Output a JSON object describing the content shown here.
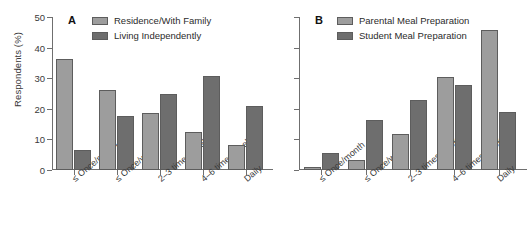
{
  "chart_data": [
    {
      "type": "bar",
      "panel": "A",
      "title": "",
      "xlabel": "",
      "ylabel": "Respondents (%)",
      "ylim": [
        0,
        50
      ],
      "yticks": [
        0,
        10,
        20,
        30,
        40,
        50
      ],
      "grid": false,
      "legend_position": "top-left",
      "categories": [
        "≤ Once/month",
        "≤ Once/week",
        "2–3 times/week",
        "4–6 times/week",
        "Daily"
      ],
      "series": [
        {
          "name": "Residence/With Family",
          "color": "#9d9d9d",
          "values": [
            36.3,
            26.2,
            18.7,
            12.5,
            8.2
          ]
        },
        {
          "name": "Living Independently",
          "color": "#6e6e6e",
          "values": [
            6.7,
            17.8,
            25.0,
            30.7,
            20.8
          ]
        }
      ]
    },
    {
      "type": "bar",
      "panel": "B",
      "title": "",
      "xlabel": "",
      "ylabel": "",
      "ylim": [
        0,
        50
      ],
      "yticks": [
        0,
        10,
        20,
        30,
        40,
        50
      ],
      "grid": false,
      "legend_position": "top-left",
      "categories": [
        "≤ Once/month",
        "≤ Once/week",
        "2–3 times/week",
        "4–6 times/week",
        "Daily"
      ],
      "series": [
        {
          "name": "Parental Meal Preparation",
          "color": "#9d9d9d",
          "values": [
            1.0,
            3.4,
            11.7,
            30.5,
            45.8
          ]
        },
        {
          "name": "Student Meal Preparation",
          "color": "#6e6e6e",
          "values": [
            5.7,
            16.2,
            23.0,
            27.8,
            18.8
          ]
        }
      ]
    }
  ],
  "axis": {
    "ylabel": "Respondents (%)",
    "ytick_labels": [
      "0",
      "10",
      "20",
      "30",
      "40",
      "50"
    ]
  },
  "panels": {
    "a": {
      "letter": "A",
      "legend": [
        {
          "label": "Residence/With Family",
          "swatch": "light"
        },
        {
          "label": "Living Independently",
          "swatch": "dark"
        }
      ],
      "xtick_labels": [
        "≤ Once/month",
        "≤ Once/week",
        "2–3 times/week",
        "4–6 times/week",
        "Daily"
      ]
    },
    "b": {
      "letter": "B",
      "legend": [
        {
          "label": "Parental Meal Preparation",
          "swatch": "light"
        },
        {
          "label": "Student Meal Preparation",
          "swatch": "dark"
        }
      ],
      "xtick_labels": [
        "≤ Once/month",
        "≤ Once/week",
        "2–3 times/week",
        "4–6 times/week",
        "Daily"
      ]
    }
  },
  "colors": {
    "light_series": "#9d9d9d",
    "dark_series": "#6e6e6e",
    "axis": "#6f6f6f",
    "text": "#2b2b2b",
    "background": "#ffffff"
  }
}
